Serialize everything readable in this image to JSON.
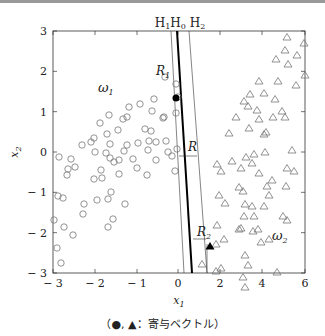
{
  "chart_data": {
    "type": "scatter",
    "title": "",
    "xlabel": "x1",
    "ylabel": "x2",
    "x_ticks": [
      "-3",
      "-2",
      "-1",
      "0",
      "2",
      "4",
      "6"
    ],
    "y_ticks": [
      "3",
      "2",
      "1",
      "0",
      "-1",
      "-2",
      "-3"
    ],
    "xlim": [
      -3,
      6
    ],
    "ylim": [
      -3,
      3
    ],
    "grid": false,
    "line_labels": [
      "H1",
      "H0",
      "H2"
    ],
    "annotations": {
      "R1": "R1",
      "R2": "R2",
      "R": "R",
      "omega1": "ω1",
      "omega2": "ω2"
    },
    "series": [
      {
        "name": "ω1",
        "marker": "open-circle",
        "description": "class 1 samples (upper-left region)"
      },
      {
        "name": "ω2",
        "marker": "open-triangle",
        "description": "class 2 samples (right region)"
      },
      {
        "name": "support vector ω1",
        "marker": "filled-circle",
        "points": [
          [
            -0.1,
            0.75
          ]
        ]
      },
      {
        "name": "support vector ω2",
        "marker": "filled-triangle",
        "points": [
          [
            1.5,
            -2.35
          ]
        ]
      }
    ],
    "px_circles": [
      [
        59,
        157
      ],
      [
        58,
        196
      ],
      [
        54,
        220
      ],
      [
        57,
        248
      ],
      [
        61,
        263
      ],
      [
        63,
        198
      ],
      [
        67,
        175
      ],
      [
        64,
        227
      ],
      [
        68,
        169
      ],
      [
        73,
        235
      ],
      [
        75,
        167
      ],
      [
        71,
        159
      ],
      [
        83,
        214
      ],
      [
        82,
        145
      ],
      [
        84,
        204
      ],
      [
        94,
        138
      ],
      [
        94,
        179
      ],
      [
        97,
        200
      ],
      [
        91,
        142
      ],
      [
        95,
        152
      ],
      [
        101,
        170
      ],
      [
        100,
        123
      ],
      [
        102,
        178
      ],
      [
        107,
        134
      ],
      [
        106,
        153
      ],
      [
        108,
        199
      ],
      [
        108,
        227
      ],
      [
        110,
        144
      ],
      [
        114,
        162
      ],
      [
        119,
        174
      ],
      [
        111,
        192
      ],
      [
        110,
        158
      ],
      [
        109,
        115
      ],
      [
        118,
        130
      ],
      [
        119,
        160
      ],
      [
        125,
        204
      ],
      [
        113,
        219
      ],
      [
        124,
        151
      ],
      [
        127,
        145
      ],
      [
        123,
        119
      ],
      [
        129,
        107
      ],
      [
        133,
        159
      ],
      [
        127,
        117
      ],
      [
        137,
        168
      ],
      [
        138,
        143
      ],
      [
        140,
        104
      ],
      [
        145,
        129
      ],
      [
        148,
        150
      ],
      [
        151,
        131
      ],
      [
        147,
        175
      ],
      [
        149,
        141
      ],
      [
        152,
        111
      ],
      [
        154,
        99
      ],
      [
        156,
        142
      ],
      [
        156,
        160
      ],
      [
        164,
        117
      ],
      [
        166,
        141
      ],
      [
        163,
        118
      ],
      [
        168,
        152
      ],
      [
        165,
        77
      ],
      [
        176,
        84
      ],
      [
        178,
        97
      ],
      [
        176,
        113
      ],
      [
        177,
        149
      ],
      [
        172,
        156
      ],
      [
        175,
        171
      ]
    ],
    "px_triangles": [
      [
        287,
        37
      ],
      [
        304,
        43
      ],
      [
        285,
        50
      ],
      [
        297,
        55
      ],
      [
        276,
        59
      ],
      [
        288,
        64
      ],
      [
        305,
        75
      ],
      [
        259,
        81
      ],
      [
        278,
        81
      ],
      [
        296,
        85
      ],
      [
        250,
        94
      ],
      [
        264,
        93
      ],
      [
        275,
        99
      ],
      [
        244,
        101
      ],
      [
        248,
        106
      ],
      [
        257,
        110
      ],
      [
        282,
        111
      ],
      [
        236,
        117
      ],
      [
        259,
        119
      ],
      [
        273,
        117
      ],
      [
        285,
        117
      ],
      [
        249,
        128
      ],
      [
        266,
        132
      ],
      [
        229,
        133
      ],
      [
        264,
        134
      ],
      [
        292,
        150
      ],
      [
        254,
        154
      ],
      [
        265,
        152
      ],
      [
        246,
        157
      ],
      [
        252,
        163
      ],
      [
        232,
        161
      ],
      [
        217,
        164
      ],
      [
        287,
        168
      ],
      [
        241,
        168
      ],
      [
        294,
        171
      ],
      [
        221,
        171
      ],
      [
        259,
        173
      ],
      [
        272,
        180
      ],
      [
        267,
        186
      ],
      [
        286,
        186
      ],
      [
        239,
        187
      ],
      [
        243,
        191
      ],
      [
        269,
        195
      ],
      [
        219,
        195
      ],
      [
        225,
        203
      ],
      [
        245,
        204
      ],
      [
        252,
        206
      ],
      [
        264,
        206
      ],
      [
        283,
        216
      ],
      [
        244,
        216
      ],
      [
        254,
        216
      ],
      [
        287,
        220
      ],
      [
        241,
        228
      ],
      [
        217,
        225
      ],
      [
        253,
        231
      ],
      [
        224,
        239
      ],
      [
        269,
        239
      ],
      [
        261,
        242
      ],
      [
        245,
        255
      ],
      [
        216,
        244
      ],
      [
        248,
        265
      ],
      [
        221,
        268
      ],
      [
        202,
        264
      ],
      [
        243,
        277
      ],
      [
        245,
        287
      ],
      [
        277,
        272
      ],
      [
        216,
        271
      ],
      [
        239,
        229
      ],
      [
        258,
        229
      ]
    ],
    "px_sv_circle": [
      176,
      98
    ],
    "px_sv_triangle": [
      210,
      246
    ]
  },
  "caption": "（●, ▲：寄与ベクトル）"
}
